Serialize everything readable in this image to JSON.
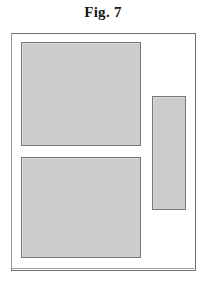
{
  "figure": {
    "caption": "Fig. 7",
    "colors": {
      "page_background": "#ffffff",
      "frame_stroke": "#6e6e6e",
      "block_fill": "#cccccc",
      "block_stroke": "#787878",
      "caption_text": "#171717"
    },
    "frame": {
      "name": "outer-enclosure",
      "fill": "#ffffff"
    },
    "blocks": [
      {
        "id": "upper-left",
        "fill": "#cccccc",
        "orientation": "landscape"
      },
      {
        "id": "lower-left",
        "fill": "#cccccc",
        "orientation": "landscape"
      },
      {
        "id": "right-vertical",
        "fill": "#cccccc",
        "orientation": "portrait"
      }
    ]
  }
}
